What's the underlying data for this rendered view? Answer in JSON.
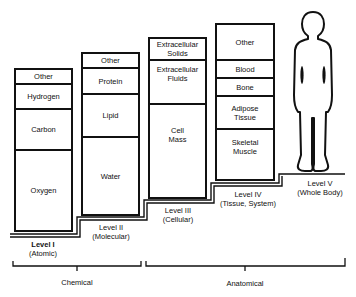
{
  "diagram": {
    "title": "",
    "levels": [
      {
        "name": "Level I",
        "subtitle": "(Atomic)",
        "components_top_to_bottom": [
          "Other",
          "Hydrogen",
          "Carbon",
          "Oxygen"
        ]
      },
      {
        "name": "Level II",
        "subtitle": "(Molecular)",
        "components_top_to_bottom": [
          "Other",
          "Protein",
          "Lipid",
          "Water"
        ]
      },
      {
        "name": "Level III",
        "subtitle": "(Cellular)",
        "components_top_to_bottom": [
          "Extracellular Solids",
          "Extracellular Fluids",
          "Cell Mass"
        ]
      },
      {
        "name": "Level IV",
        "subtitle": "(Tissue, System)",
        "components_top_to_bottom": [
          "Other",
          "Blood",
          "Bone",
          "Adipose Tissue",
          "Skeletal Muscle"
        ]
      },
      {
        "name": "Level V",
        "subtitle": "(Whole Body)",
        "components_top_to_bottom": []
      }
    ],
    "groups": [
      {
        "label": "Chemical",
        "spans": [
          "Level I",
          "Level II"
        ]
      },
      {
        "label": "Anatomical",
        "spans": [
          "Level III",
          "Level IV",
          "Level V"
        ]
      }
    ],
    "figure_icon": "human-body-silhouette",
    "colors": {
      "line": "#111111",
      "background": "#ffffff"
    }
  },
  "l1": {
    "name": "Level I",
    "sub": "(Atomic)",
    "c0": "Other",
    "c1": "Hydrogen",
    "c2": "Carbon",
    "c3": "Oxygen"
  },
  "l2": {
    "name": "Level II",
    "sub": "(Molecular)",
    "c0": "Other",
    "c1": "Protein",
    "c2": "Lipid",
    "c3": "Water"
  },
  "l3": {
    "name": "Level III",
    "sub": "(Cellular)",
    "c0a": "Extracellular",
    "c0b": "Solids",
    "c1a": "Extracellular",
    "c1b": "Fluids",
    "c2a": "Cell",
    "c2b": "Mass"
  },
  "l4": {
    "name": "Level IV",
    "sub": "(Tissue, System)",
    "c0": "Other",
    "c1": "Blood",
    "c2": "Bone",
    "c3a": "Adipose",
    "c3b": "Tissue",
    "c4a": "Skeletal",
    "c4b": "Muscle"
  },
  "l5": {
    "name": "Level V",
    "sub": "(Whole Body)"
  },
  "groups": {
    "chemical": "Chemical",
    "anatomical": "Anatomical"
  }
}
